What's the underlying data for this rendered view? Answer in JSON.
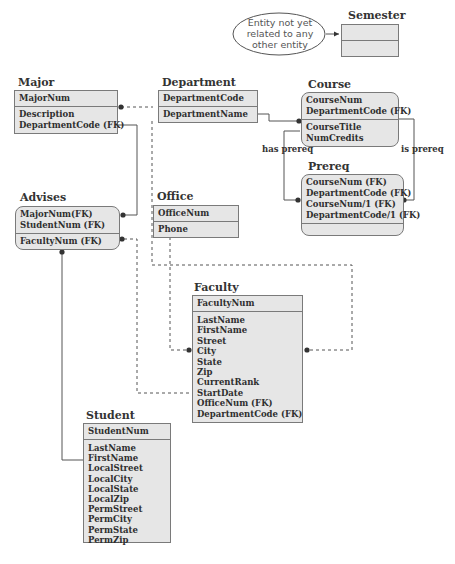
{
  "note": {
    "line1": "Entity not yet",
    "line2": "related to any",
    "line3": "other entity"
  },
  "labels": {
    "has_prereq": "has prereq",
    "is_prereq": "is prereq"
  },
  "entities": {
    "semester": {
      "title": "Semester",
      "keys": [],
      "attrs": []
    },
    "major": {
      "title": "Major",
      "keys": [
        "MajorNum"
      ],
      "attrs": [
        "Description",
        "DepartmentCode (FK)"
      ]
    },
    "department": {
      "title": "Department",
      "keys": [
        "DepartmentCode"
      ],
      "attrs": [
        "DepartmentName"
      ]
    },
    "course": {
      "title": "Course",
      "keys": [
        "CourseNum",
        "DepartmentCode (FK)"
      ],
      "attrs": [
        "CourseTitle",
        "NumCredits"
      ]
    },
    "prereq": {
      "title": "Prereq",
      "keys": [
        "CourseNum (FK)",
        "DepartmentCode (FK)",
        "CourseNum/1 (FK)",
        "DepartmentCode/1 (FK)"
      ],
      "attrs": []
    },
    "advises": {
      "title": "Advises",
      "keys": [
        "MajorNum(FK)",
        "StudentNum (FK)"
      ],
      "attrs": [
        "FacultyNum (FK)"
      ]
    },
    "office": {
      "title": "Office",
      "keys": [
        "OfficeNum"
      ],
      "attrs": [
        "Phone"
      ]
    },
    "faculty": {
      "title": "Faculty",
      "keys": [
        "FacultyNum"
      ],
      "attrs": [
        "LastName",
        "FirstName",
        "Street",
        "City",
        "State",
        "Zip",
        "CurrentRank",
        "StartDate",
        "OfficeNum (FK)",
        "DepartmentCode (FK)"
      ]
    },
    "student": {
      "title": "Student",
      "keys": [
        "StudentNum"
      ],
      "attrs": [
        "LastName",
        "FirstName",
        "LocalStreet",
        "LocalCity",
        "LocalState",
        "LocalZip",
        "PermStreet",
        "PermCity",
        "PermState",
        "PermZip"
      ]
    }
  },
  "colors": {
    "entity_fill": "#e6e6e6",
    "border": "#7a7a7a",
    "line": "#444444"
  }
}
